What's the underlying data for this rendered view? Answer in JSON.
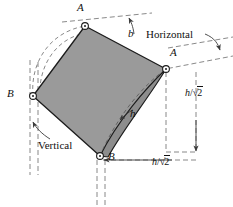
{
  "figure": {
    "colors": {
      "shade_fill": "#9a9a9a",
      "outline": "#1c1c1c",
      "dashed": "#6b6b6b",
      "text": "#111111"
    },
    "vertices": [
      {
        "id": "A-top",
        "label": "A",
        "x": 85,
        "y": 26
      },
      {
        "id": "A-right",
        "label": "A",
        "x": 166,
        "y": 69
      },
      {
        "id": "B-left",
        "label": "B",
        "x": 33,
        "y": 96
      },
      {
        "id": "B-bottom",
        "label": "B",
        "x": 100,
        "y": 156
      }
    ],
    "labels": {
      "b": "b",
      "horizontal": "Horizontal",
      "vertical": "Vertical",
      "h": "h",
      "h_over_sqrt2_vertical": "h/√2",
      "h_over_sqrt2_horizontal": "h/√2",
      "radicand": "2",
      "numerator": "h",
      "slash": "/"
    },
    "annotations": [
      {
        "name": "b-dimension",
        "text": "b",
        "target": "top-edge-dashed-line"
      },
      {
        "name": "horizontal-callout",
        "text": "Horizontal",
        "target": "right-dashed-line"
      },
      {
        "name": "vertical-callout",
        "text": "Vertical",
        "target": "left-dashed-vertical-lines"
      },
      {
        "name": "h-arc-label",
        "text": "h",
        "target": "interior-arc"
      },
      {
        "name": "height-dimension",
        "text": "h/√2",
        "target": "right-vertical-dimension"
      },
      {
        "name": "width-dimension",
        "text": "h/√2",
        "target": "bottom-horizontal-dimension"
      }
    ]
  }
}
